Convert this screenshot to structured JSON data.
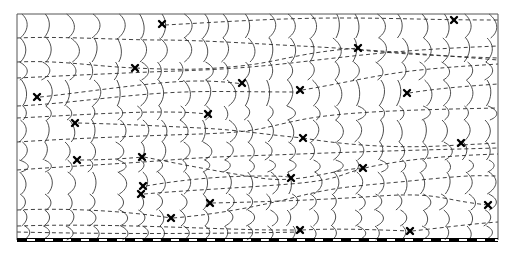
{
  "diagram": {
    "frame": {
      "x": 17,
      "y": 14,
      "width": 481,
      "height": 226
    },
    "baseline": {
      "y": 240,
      "dash_black": 10,
      "dash_white": 8,
      "color": "#000000"
    },
    "colors": {
      "curve": "#3a3a3a",
      "flow": "#2a2a2a",
      "marker": "#000000",
      "background": "#ffffff"
    },
    "markers": [
      {
        "x": 162,
        "y": 24
      },
      {
        "x": 454,
        "y": 20
      },
      {
        "x": 358,
        "y": 48
      },
      {
        "x": 135,
        "y": 68
      },
      {
        "x": 242,
        "y": 83
      },
      {
        "x": 300,
        "y": 90
      },
      {
        "x": 37,
        "y": 97
      },
      {
        "x": 407,
        "y": 93
      },
      {
        "x": 208,
        "y": 114
      },
      {
        "x": 75,
        "y": 123
      },
      {
        "x": 303,
        "y": 138
      },
      {
        "x": 461,
        "y": 143
      },
      {
        "x": 142,
        "y": 157
      },
      {
        "x": 77,
        "y": 160
      },
      {
        "x": 363,
        "y": 168
      },
      {
        "x": 291,
        "y": 178
      },
      {
        "x": 143,
        "y": 186
      },
      {
        "x": 141,
        "y": 194
      },
      {
        "x": 210,
        "y": 203
      },
      {
        "x": 488,
        "y": 205
      },
      {
        "x": 171,
        "y": 218
      },
      {
        "x": 300,
        "y": 230
      },
      {
        "x": 410,
        "y": 231
      }
    ],
    "flow_lines": [
      "M17,38 C60,36 120,40 160,40 S260,44 300,46 S400,52 498,60",
      "M165,25 C220,22 280,18 340,18 S430,20 498,20",
      "M17,62 C60,60 90,66 135,68 S200,70 240,66 S300,52 360,48",
      "M360,50 C400,54 440,56 498,58",
      "M17,78 C60,76 100,74 150,72 S230,70 300,62 S400,50 498,46",
      "M40,97 C70,94 110,88 150,84 S210,80 244,84",
      "M302,90 C340,84 380,74 420,70 S470,66 498,64",
      "M17,106 C60,104 100,98 150,94 S230,92 300,92",
      "M409,93 C440,88 470,86 498,84",
      "M17,118 C60,116 120,112 160,112 S200,114 210,114",
      "M78,123 C120,124 160,126 200,128 S260,134 303,138",
      "M303,138 C350,146 400,148 440,146 S480,144 498,143",
      "M17,142 C80,138 140,136 200,134 S260,128 300,120 S400,110 498,108",
      "M80,160 C110,160 130,158 144,157",
      "M144,157 C180,164 220,172 260,178 S330,170 363,168",
      "M17,170 C70,166 120,164 170,160 S250,156 300,154 S420,150 498,148",
      "M146,186 C180,180 220,176 260,176 S285,178 291,178",
      "M144,194 C190,190 240,188 290,184 S340,174 365,168",
      "M365,168 C400,160 440,156 498,154",
      "M212,203 C260,202 320,200 380,196 S440,200 488,205",
      "M17,210 C60,208 120,210 171,218",
      "M173,218 C220,214 260,206 300,196 S360,186 420,180 S480,176 498,176",
      "M17,226 C80,224 140,226 200,228 S260,230 300,230",
      "M412,231 C440,228 470,224 498,222",
      "M302,230 C340,228 380,230 410,231",
      "M17,232 C100,234 200,234 300,232"
    ],
    "curve_columns": [
      22,
      45,
      68,
      92,
      118,
      140,
      160,
      182,
      204,
      226,
      248,
      268,
      290,
      312,
      334,
      356,
      378,
      400,
      422,
      444,
      466,
      488
    ]
  }
}
